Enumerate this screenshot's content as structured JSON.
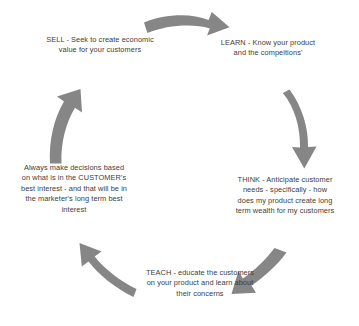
{
  "diagram": {
    "type": "circular-process-cycle",
    "background_color": "#ffffff",
    "arrow_color": "#808080",
    "text_color": "#3d3d3d",
    "stages": [
      {
        "id": "sell",
        "name": "SELL",
        "text": "SELL - Seek to create economic value for your customers",
        "position": "top-left"
      },
      {
        "id": "learn",
        "name": "LEARN",
        "text": "LEARN - Know your product and the compeitions'",
        "position": "top-right"
      },
      {
        "id": "think",
        "name": "THINK",
        "text": "THINK - Anticipate customer needs - specifically - how does my product create long term wealth for my customers",
        "position": "right"
      },
      {
        "id": "teach",
        "name": "TEACH",
        "text": "TEACH - educate the customers on your product and learn about their concerns",
        "position": "bottom"
      },
      {
        "id": "principle",
        "name": "Always make decisions",
        "text": "Always make decisions based on what is in the CUSTOMER's best interest - and that will be in the marketer's long term best interest",
        "position": "left"
      }
    ],
    "arrows": [
      {
        "id": "arrow-sell-to-learn",
        "from": "sell",
        "to": "learn",
        "direction": "right"
      },
      {
        "id": "arrow-learn-to-think",
        "from": "learn",
        "to": "think",
        "direction": "down"
      },
      {
        "id": "arrow-think-to-teach",
        "from": "think",
        "to": "teach",
        "direction": "down-left"
      },
      {
        "id": "arrow-teach-to-principle",
        "from": "teach",
        "to": "principle",
        "direction": "up-left"
      },
      {
        "id": "arrow-principle-to-sell",
        "from": "principle",
        "to": "sell",
        "direction": "up"
      }
    ]
  }
}
